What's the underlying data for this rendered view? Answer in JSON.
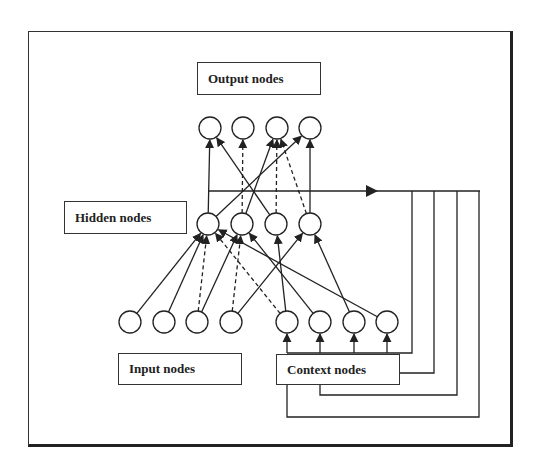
{
  "diagram": {
    "type": "recurrent-neural-network",
    "labels": {
      "output": "Output nodes",
      "hidden": "Hidden nodes",
      "input": "Input nodes",
      "context": "Context nodes"
    },
    "layers": {
      "output": [
        {
          "id": "O1",
          "x": 210,
          "y": 128
        },
        {
          "id": "O2",
          "x": 243,
          "y": 128
        },
        {
          "id": "O3",
          "x": 277,
          "y": 128
        },
        {
          "id": "O4",
          "x": 310,
          "y": 128
        }
      ],
      "hidden": [
        {
          "id": "H1",
          "x": 208,
          "y": 224
        },
        {
          "id": "H2",
          "x": 242,
          "y": 224
        },
        {
          "id": "H3",
          "x": 276,
          "y": 224
        },
        {
          "id": "H4",
          "x": 310,
          "y": 224
        }
      ],
      "input": [
        {
          "id": "I1",
          "x": 130,
          "y": 322
        },
        {
          "id": "I2",
          "x": 164,
          "y": 322
        },
        {
          "id": "I3",
          "x": 197,
          "y": 322
        },
        {
          "id": "I4",
          "x": 231,
          "y": 322
        }
      ],
      "context": [
        {
          "id": "C1",
          "x": 287,
          "y": 322
        },
        {
          "id": "C2",
          "x": 320,
          "y": 322
        },
        {
          "id": "C3",
          "x": 354,
          "y": 322
        },
        {
          "id": "C4",
          "x": 387,
          "y": 322
        }
      ]
    },
    "node_radius": 11,
    "edges": [
      {
        "from": "H1",
        "to": "O1",
        "style": "solid"
      },
      {
        "from": "H1",
        "to": "O4",
        "style": "solid"
      },
      {
        "from": "H2",
        "to": "O2",
        "style": "dashed"
      },
      {
        "from": "H2",
        "to": "O3",
        "style": "solid"
      },
      {
        "from": "H3",
        "to": "O1",
        "style": "solid"
      },
      {
        "from": "H3",
        "to": "O3",
        "style": "dashed"
      },
      {
        "from": "H4",
        "to": "O3",
        "style": "dashed"
      },
      {
        "from": "H4",
        "to": "O4",
        "style": "solid"
      },
      {
        "from": "I1",
        "to": "H1",
        "style": "solid"
      },
      {
        "from": "I2",
        "to": "H1",
        "style": "solid"
      },
      {
        "from": "I3",
        "to": "H1",
        "style": "dashed"
      },
      {
        "from": "I3",
        "to": "H2",
        "style": "solid"
      },
      {
        "from": "I4",
        "to": "H2",
        "style": "dashed"
      },
      {
        "from": "I4",
        "to": "H4",
        "style": "solid"
      },
      {
        "from": "C1",
        "to": "H1",
        "style": "dashed"
      },
      {
        "from": "C1",
        "to": "H3",
        "style": "solid"
      },
      {
        "from": "C2",
        "to": "H2",
        "style": "solid"
      },
      {
        "from": "C3",
        "to": "H4",
        "style": "solid"
      },
      {
        "from": "C4",
        "to": "H1",
        "style": "solid"
      }
    ],
    "feedback": {
      "bus_y": 191,
      "bus_x_start": 208,
      "bus_x_end": 480,
      "arrow_x": 378,
      "drops": [
        412,
        434,
        457,
        479
      ]
    }
  }
}
